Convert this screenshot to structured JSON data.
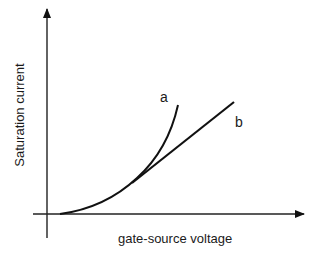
{
  "diagram": {
    "x_axis_label": "gate-source voltage",
    "y_axis_label": "Saturation current",
    "curves": [
      {
        "id": "a",
        "label": "a",
        "description": "square-law curve (continues curving upward)"
      },
      {
        "id": "b",
        "label": "b",
        "description": "linear region (straight line branching from curve)"
      }
    ],
    "colors": {
      "line": "#111111",
      "background": "#ffffff"
    }
  }
}
